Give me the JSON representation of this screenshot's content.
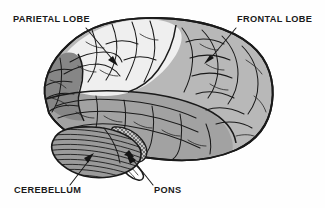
{
  "figure": {
    "background_color": "#fefefe",
    "width": 325,
    "height": 208
  },
  "labels": [
    {
      "id": "parietal-lobe",
      "text": "PARIETAL LOBE",
      "position": "top-left",
      "x": 13,
      "y": 22,
      "leader_from": [
        88,
        26
      ],
      "leader_to": [
        116,
        63
      ],
      "arrow": true
    },
    {
      "id": "frontal-lobe",
      "text": "FRONTAL LOBE",
      "position": "top-right",
      "x": 237,
      "y": 22,
      "leader_from": [
        234,
        26
      ],
      "leader_to": [
        207,
        62
      ],
      "arrow": true
    },
    {
      "id": "cerebellum",
      "text": "CEREBELLUM",
      "position": "bottom-left",
      "x": 14,
      "y": 193,
      "leader_from": [
        72,
        186
      ],
      "leader_to": [
        92,
        156
      ],
      "arrow": true
    },
    {
      "id": "pons",
      "text": "PONS",
      "position": "bottom-center",
      "x": 154,
      "y": 193,
      "leader_from": [
        152,
        186
      ],
      "leader_to": [
        131,
        158
      ],
      "arrow": true
    }
  ],
  "regions": [
    {
      "id": "parietal",
      "name": "Parietal lobe",
      "fill": "#efefef",
      "shade": "very light gray"
    },
    {
      "id": "frontal",
      "name": "Frontal lobe",
      "fill": "#b8b8b8",
      "shade": "light-medium gray"
    },
    {
      "id": "temporal",
      "name": "Temporal lobe",
      "fill": "#a2a2a2",
      "shade": "medium gray"
    },
    {
      "id": "occipital",
      "name": "Occipital lobe",
      "fill": "#868686",
      "shade": "dark gray"
    },
    {
      "id": "cerebellum-region",
      "name": "Cerebellum",
      "fill": "#9a9a9a",
      "shade": "medium gray with radial hatching"
    },
    {
      "id": "brainstem",
      "name": "Brainstem / pons",
      "fill": "#c4c4c4",
      "shade": "cross-hatched light gray"
    }
  ],
  "colors": {
    "outline": "#1a1a1a",
    "text": "#1a1a1a",
    "background": "#fefefe"
  }
}
